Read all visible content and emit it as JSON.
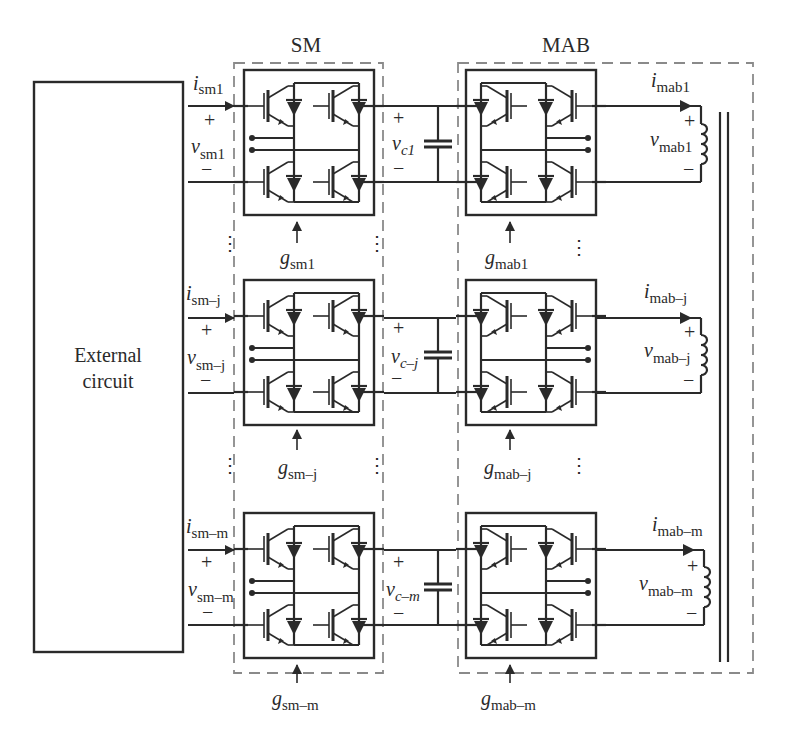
{
  "figure": {
    "external_circuit": {
      "line1": "External",
      "line2": "circuit"
    },
    "groups": {
      "sm": {
        "title": "SM"
      },
      "mab": {
        "title": "MAB"
      }
    },
    "modules": [
      {
        "id": "1",
        "i_sm": {
          "base": "i",
          "sub": "sm1"
        },
        "v_sm": {
          "base": "v",
          "sub": "sm1"
        },
        "g_sm": {
          "base": "g",
          "sub": "sm1"
        },
        "v_c": {
          "base": "v",
          "sub": "c1"
        },
        "g_mab": {
          "base": "g",
          "sub": "mab1"
        },
        "i_mab": {
          "base": "i",
          "sub": "mab1"
        },
        "v_mab": {
          "base": "v",
          "sub": "mab1"
        }
      },
      {
        "id": "j",
        "i_sm": {
          "base": "i",
          "sub": "sm–j"
        },
        "v_sm": {
          "base": "v",
          "sub": "sm–j"
        },
        "g_sm": {
          "base": "g",
          "sub": "sm–j"
        },
        "v_c": {
          "base": "v",
          "sub": "c–j"
        },
        "g_mab": {
          "base": "g",
          "sub": "mab–j"
        },
        "i_mab": {
          "base": "i",
          "sub": "mab–j"
        },
        "v_mab": {
          "base": "v",
          "sub": "mab–j"
        }
      },
      {
        "id": "m",
        "i_sm": {
          "base": "i",
          "sub": "sm–m"
        },
        "v_sm": {
          "base": "v",
          "sub": "sm–m"
        },
        "g_sm": {
          "base": "g",
          "sub": "sm–m"
        },
        "v_c": {
          "base": "v",
          "sub": "c–m"
        },
        "g_mab": {
          "base": "g",
          "sub": "mab–m"
        },
        "i_mab": {
          "base": "i",
          "sub": "mab–m"
        },
        "v_mab": {
          "base": "v",
          "sub": "mab–m"
        }
      }
    ],
    "symbols": {
      "plus": "+",
      "minus": "−",
      "vdots": "⋮"
    },
    "colors": {
      "ink": "#2a2a2a",
      "dashed_border": "#8a8a8a",
      "background": "#ffffff"
    }
  }
}
